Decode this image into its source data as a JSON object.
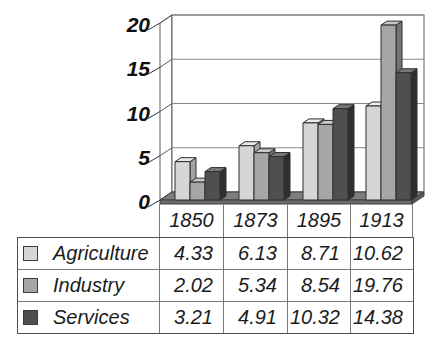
{
  "chart_data": {
    "type": "bar",
    "style": "3d-clustered-column-with-data-table",
    "title": "",
    "xlabel": "",
    "ylabel": "",
    "categories": [
      "1850",
      "1873",
      "1895",
      "1913"
    ],
    "series": [
      {
        "name": "Agriculture",
        "values": [
          4.33,
          6.13,
          8.71,
          10.62
        ],
        "front_color": "#d6d6d6",
        "top_color": "#ebebeb",
        "side_color": "#a4a4a4"
      },
      {
        "name": "Industry",
        "values": [
          2.02,
          5.34,
          8.54,
          19.76
        ],
        "front_color": "#a6a6a6",
        "top_color": "#c8c8c8",
        "side_color": "#747474"
      },
      {
        "name": "Services",
        "values": [
          3.21,
          4.91,
          10.32,
          14.38
        ],
        "front_color": "#4f4f4f",
        "top_color": "#787878",
        "side_color": "#2e2e2e"
      }
    ],
    "yticks": [
      0,
      5,
      10,
      15,
      20
    ],
    "ylim": [
      0,
      20
    ],
    "grid": true,
    "legend_position": "data-table-left-column",
    "value_format": "2-decimals"
  },
  "colors": {
    "background": "#ffffff",
    "floor_top": "#7d7d7d",
    "floor_front": "#6b6b6b",
    "floor_side": "#5a5a5a",
    "wall_stroke": "#5a5a5a",
    "grid_line": "#8a8a8a",
    "bar_outline": "#2f2f2f",
    "table_outer_border": "#4f4f4f",
    "table_inner_border": "#7a7a7a",
    "text": "#1c1c1c"
  }
}
